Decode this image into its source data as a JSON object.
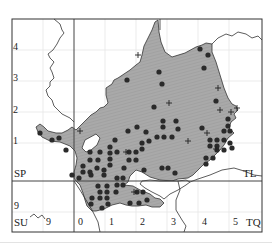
{
  "map": {
    "title": "",
    "colors": {
      "frame": "#333333",
      "grid_minor": "#e6e6e6",
      "grid_major": "#444444",
      "fill": "#a9a9a9",
      "coast": "#333333",
      "dot": "#2a2a2a",
      "cross": "#222222"
    },
    "left_labels": [
      {
        "text": "4",
        "x": 13,
        "y": 42
      },
      {
        "text": "3",
        "x": 13,
        "y": 73
      },
      {
        "text": "2",
        "x": 13,
        "y": 105
      },
      {
        "text": "1",
        "x": 13,
        "y": 136
      }
    ],
    "square_labels": [
      {
        "text": "SP",
        "x": 14,
        "y": 168,
        "name": "square-label-sp"
      },
      {
        "text": "TL",
        "x": 243,
        "y": 168,
        "name": "square-label-tl"
      },
      {
        "text": "SU",
        "x": 14,
        "y": 217,
        "name": "square-label-su"
      },
      {
        "text": "TQ",
        "x": 246,
        "y": 217,
        "name": "square-label-tq"
      }
    ],
    "lower_left_labels": [
      {
        "text": "9",
        "x": 14,
        "y": 201
      },
      {
        "text": "9",
        "x": 46,
        "y": 217
      }
    ],
    "bottom_labels": [
      {
        "text": "0",
        "x": 78,
        "y": 217
      },
      {
        "text": "1",
        "x": 109,
        "y": 217
      },
      {
        "text": "2",
        "x": 140,
        "y": 217
      },
      {
        "text": "3",
        "x": 171,
        "y": 217
      },
      {
        "text": "4",
        "x": 202,
        "y": 217
      },
      {
        "text": "5",
        "x": 233,
        "y": 217
      }
    ],
    "legend": {
      "dot_meaning": "recorded (recent)",
      "cross_meaning": "recorded (older)"
    },
    "dots": [
      [
        127,
        80
      ],
      [
        159,
        72
      ],
      [
        162,
        84
      ],
      [
        154,
        107
      ],
      [
        200,
        49
      ],
      [
        208,
        55
      ],
      [
        204,
        68
      ],
      [
        216,
        101
      ],
      [
        228,
        119
      ],
      [
        40,
        133
      ],
      [
        52,
        140
      ],
      [
        59,
        138
      ],
      [
        66,
        150
      ],
      [
        163,
        121
      ],
      [
        176,
        121
      ],
      [
        163,
        127
      ],
      [
        178,
        129
      ],
      [
        137,
        127
      ],
      [
        146,
        132
      ],
      [
        128,
        131
      ],
      [
        115,
        140
      ],
      [
        149,
        141
      ],
      [
        157,
        137
      ],
      [
        164,
        137
      ],
      [
        172,
        137
      ],
      [
        210,
        140
      ],
      [
        217,
        140
      ],
      [
        224,
        140
      ],
      [
        210,
        146
      ],
      [
        217,
        146
      ],
      [
        230,
        143
      ],
      [
        142,
        143
      ],
      [
        142,
        149
      ],
      [
        202,
        128
      ],
      [
        224,
        131
      ],
      [
        230,
        131
      ],
      [
        228,
        126
      ],
      [
        110,
        147
      ],
      [
        110,
        153
      ],
      [
        110,
        159
      ],
      [
        110,
        165
      ],
      [
        100,
        152
      ],
      [
        117,
        152
      ],
      [
        90,
        152
      ],
      [
        90,
        160
      ],
      [
        98,
        160
      ],
      [
        104,
        170
      ],
      [
        97,
        168
      ],
      [
        124,
        168
      ],
      [
        129,
        160
      ],
      [
        136,
        160
      ],
      [
        129,
        152
      ],
      [
        136,
        152
      ],
      [
        144,
        170
      ],
      [
        83,
        166
      ],
      [
        83,
        172
      ],
      [
        90,
        172
      ],
      [
        104,
        175
      ],
      [
        91,
        175
      ],
      [
        162,
        168
      ],
      [
        168,
        168
      ],
      [
        175,
        173
      ],
      [
        206,
        158
      ],
      [
        213,
        158
      ],
      [
        206,
        164
      ],
      [
        217,
        150
      ],
      [
        224,
        150
      ],
      [
        232,
        148
      ],
      [
        123,
        178
      ],
      [
        117,
        178
      ],
      [
        117,
        185
      ],
      [
        123,
        185
      ],
      [
        116,
        192
      ],
      [
        98,
        186
      ],
      [
        107,
        186
      ],
      [
        100,
        192
      ],
      [
        107,
        192
      ],
      [
        92,
        198
      ],
      [
        100,
        198
      ],
      [
        107,
        198
      ],
      [
        91,
        204
      ],
      [
        102,
        208
      ],
      [
        108,
        204
      ],
      [
        137,
        192
      ],
      [
        143,
        192
      ],
      [
        147,
        200
      ],
      [
        130,
        203
      ],
      [
        139,
        203
      ],
      [
        72,
        175
      ],
      [
        79,
        178
      ]
    ],
    "crosses": [
      [
        138,
        55
      ],
      [
        218,
        88
      ],
      [
        220,
        110
      ],
      [
        231,
        112
      ],
      [
        207,
        133
      ],
      [
        169,
        103
      ],
      [
        237,
        108
      ],
      [
        80,
        131
      ],
      [
        126,
        152
      ],
      [
        188,
        141
      ],
      [
        134,
        192
      ],
      [
        216,
        149
      ]
    ]
  }
}
